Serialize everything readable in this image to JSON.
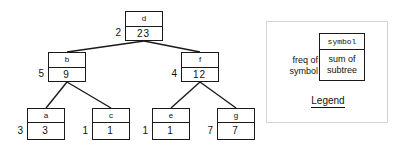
{
  "diagram": {
    "nodes": [
      {
        "id": "d",
        "symbol": "d",
        "sum": "23",
        "freq": "2",
        "x": 125,
        "y": 11,
        "w": 38,
        "h": 30,
        "role": "root"
      },
      {
        "id": "b",
        "symbol": "b",
        "sum": "9",
        "freq": "5",
        "x": 48,
        "y": 52,
        "w": 38,
        "h": 30,
        "role": "internal"
      },
      {
        "id": "f",
        "symbol": "f",
        "sum": "12",
        "freq": "4",
        "x": 181,
        "y": 52,
        "w": 38,
        "h": 30,
        "role": "internal"
      },
      {
        "id": "a",
        "symbol": "a",
        "sum": "3",
        "freq": "3",
        "x": 27,
        "y": 108,
        "w": 38,
        "h": 32,
        "role": "leaf"
      },
      {
        "id": "c",
        "symbol": "c",
        "sum": "1",
        "freq": "1",
        "x": 92,
        "y": 108,
        "w": 38,
        "h": 32,
        "role": "leaf"
      },
      {
        "id": "e",
        "symbol": "e",
        "sum": "1",
        "freq": "1",
        "x": 152,
        "y": 108,
        "w": 38,
        "h": 32,
        "role": "leaf"
      },
      {
        "id": "g",
        "symbol": "g",
        "sum": "7",
        "freq": "7",
        "x": 217,
        "y": 108,
        "w": 38,
        "h": 32,
        "role": "leaf"
      }
    ],
    "edges": [
      {
        "from": "d",
        "to": "b",
        "x1": 144,
        "y1": 41,
        "x2": 67,
        "y2": 52
      },
      {
        "from": "d",
        "to": "f",
        "x1": 144,
        "y1": 41,
        "x2": 200,
        "y2": 52
      },
      {
        "from": "b",
        "to": "a",
        "x1": 67,
        "y1": 82,
        "x2": 46,
        "y2": 108
      },
      {
        "from": "b",
        "to": "c",
        "x1": 67,
        "y1": 82,
        "x2": 111,
        "y2": 108
      },
      {
        "from": "f",
        "to": "e",
        "x1": 200,
        "y1": 82,
        "x2": 171,
        "y2": 108
      },
      {
        "from": "f",
        "to": "g",
        "x1": 200,
        "y1": 82,
        "x2": 236,
        "y2": 108
      }
    ]
  },
  "legend": {
    "symbol_cell": "symbol",
    "sum_line1": "sum of",
    "sum_line2": "subtree",
    "left_line1": "freq of",
    "left_line2": "symbol",
    "caption": "Legend"
  },
  "colors": {
    "ink": "#1a1a1a",
    "text": "#111111",
    "frame": "#d2d2d2",
    "background": "#ffffff"
  }
}
